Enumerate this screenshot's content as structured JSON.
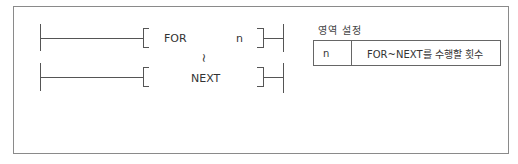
{
  "diagram": {
    "type": "ladder-instruction",
    "rungs": [
      {
        "instruction": "FOR",
        "operand": "n"
      },
      {
        "instruction": "NEXT",
        "operand": ""
      }
    ],
    "continuation_symbol": "~"
  },
  "settings": {
    "caption": "영역 설정",
    "rows": [
      {
        "key": "n",
        "description": "FOR~NEXT를 수행할 횟수"
      }
    ]
  }
}
